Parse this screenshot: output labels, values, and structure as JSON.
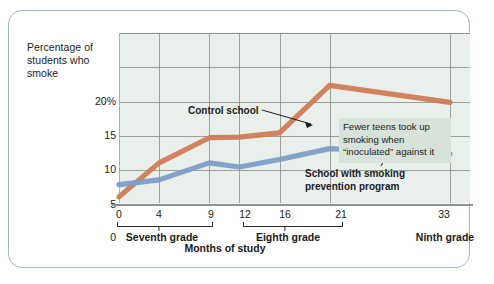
{
  "figure": {
    "y_axis_caption": "Percentage of students who smoke",
    "x_axis_title": "Months of study"
  },
  "annotations": {
    "control": "Control school",
    "program_line1": "School with smoking",
    "program_line2": "prevention program",
    "callout": "Fewer teens took up smoking when “inoculated” against it"
  },
  "grade_bands": [
    {
      "label": "Seventh grade",
      "start": 0,
      "end": 9,
      "center": 4
    },
    {
      "label": "Eighth grade",
      "start": 12,
      "end": 21,
      "center": 16
    },
    {
      "label": "Ninth grade",
      "start": 33,
      "end": 33,
      "center": 33
    }
  ],
  "chart_data": {
    "type": "line",
    "title": "",
    "subtitle": "",
    "xlabel": "Months of study",
    "ylabel": "Percentage of students who smoke",
    "x": [
      0,
      4,
      9,
      12,
      16,
      21,
      33
    ],
    "xtick_labels": [
      "0",
      "4",
      "9",
      "12",
      "16",
      "21",
      "33"
    ],
    "ytick_labels": [
      "0",
      "5",
      "10",
      "15",
      "20%"
    ],
    "ytick_values": [
      0,
      5,
      10,
      15,
      20
    ],
    "xlim": [
      0,
      35
    ],
    "ylim": [
      0,
      21.7
    ],
    "grid": true,
    "legend_position": "inline-annotations",
    "series": [
      {
        "name": "Control school",
        "color": "#cf7c56",
        "values": [
          0.9,
          5.9,
          9.6,
          9.7,
          10.3,
          17.3,
          14.8
        ]
      },
      {
        "name": "School with smoking prevention program",
        "color": "#7d9ec7",
        "values": [
          2.7,
          3.4,
          5.9,
          5.3,
          6.4,
          8.0,
          7.2
        ]
      }
    ],
    "annotations": [
      {
        "text": "Control school",
        "target_series": "Control school",
        "target_x": 21
      },
      {
        "text": "School with smoking prevention program",
        "target_series": "School with smoking prevention program",
        "target_x": 23
      },
      {
        "text": "Fewer teens took up smoking when “inoculated” against it",
        "target_x": 27
      }
    ]
  },
  "colors": {
    "control_line": "#cf7c56",
    "program_line": "#7d9ec7",
    "plot_background": "#e9efea",
    "gridline": "#8e938f",
    "frame_border": "#9fb4d8",
    "callout_background": "#d7e3da"
  }
}
